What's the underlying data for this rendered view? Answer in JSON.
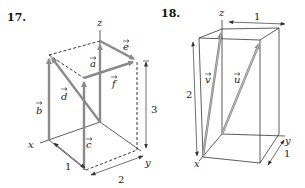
{
  "figures": [
    {
      "number": "17.",
      "axes": {
        "x": "x",
        "y": "y",
        "z": "z"
      },
      "vectors": [
        "a",
        "b",
        "c",
        "d",
        "e",
        "f"
      ],
      "dimensions": {
        "x_length": "1",
        "y_length": "2",
        "z_height": "3"
      }
    },
    {
      "number": "18.",
      "axes": {
        "x": "x",
        "y": "y",
        "z": "z"
      },
      "vectors": [
        "v",
        "u"
      ],
      "dimensions": {
        "top_width": "1",
        "height": "2",
        "depth": "1"
      }
    }
  ],
  "colors": {
    "vector": "#8a8a8a",
    "line": "#333333"
  }
}
